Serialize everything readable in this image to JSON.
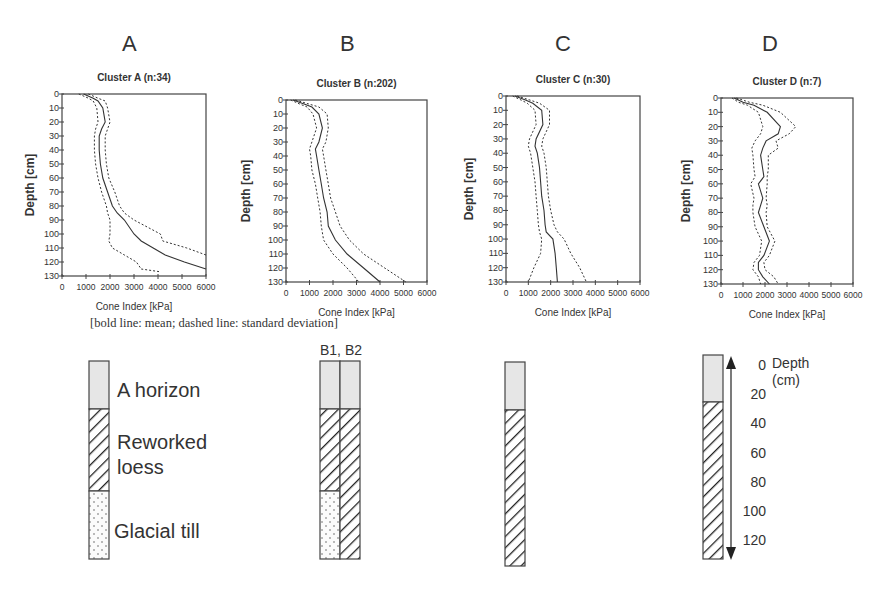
{
  "panel_letters": [
    "A",
    "B",
    "C",
    "D"
  ],
  "caption": "[bold line: mean; dashed line: standard deviation]",
  "legend": {
    "a_horizon": "A horizon",
    "reworked_loess_1": "Reworked",
    "reworked_loess_2": "loess",
    "glacial_till": "Glacial till",
    "b_columns_label": "B1, B2",
    "depth_title_1": "Depth",
    "depth_title_2": "(cm)",
    "depth_ticks": [
      "0",
      "20",
      "40",
      "60",
      "80",
      "100",
      "120"
    ]
  },
  "colors": {
    "a_horizon_fill": "#e6e6e6",
    "line": "#333333",
    "frame": "#444444"
  },
  "chart_data": [
    {
      "type": "line",
      "title": "Cluster A (n:34)",
      "xlabel": "Cone Index [kPa]",
      "ylabel": "Depth [cm]",
      "xlim": [
        0,
        6000
      ],
      "ylim": [
        0,
        130
      ],
      "y_inverted": true,
      "xticks": [
        "0",
        "1000",
        "2000",
        "3000",
        "4000",
        "5000",
        "6000"
      ],
      "yticks": [
        "0",
        "10",
        "20",
        "30",
        "40",
        "50",
        "60",
        "70",
        "80",
        "90",
        "100",
        "110",
        "120",
        "130"
      ],
      "depth": [
        0,
        3,
        5,
        10,
        20,
        25,
        30,
        40,
        50,
        60,
        70,
        80,
        85,
        90,
        100,
        105,
        110,
        115,
        120,
        125
      ],
      "series": [
        {
          "name": "mean",
          "style": "solid",
          "values": [
            900,
            1300,
            1500,
            1700,
            1800,
            1650,
            1550,
            1550,
            1600,
            1700,
            1900,
            2100,
            2300,
            2600,
            3000,
            3300,
            3800,
            4300,
            5100,
            6000
          ]
        },
        {
          "name": "mean + sd",
          "style": "dashed",
          "values": [
            1100,
            1500,
            1800,
            1900,
            2000,
            1900,
            1800,
            1800,
            1850,
            1950,
            2200,
            2400,
            2600,
            3000,
            4100,
            4200,
            5200,
            6000,
            null,
            null
          ]
        },
        {
          "name": "mean - sd",
          "style": "dashed",
          "values": [
            700,
            1100,
            1300,
            1450,
            1500,
            1400,
            1350,
            1350,
            1400,
            1500,
            1650,
            1850,
            1900,
            2000,
            2000,
            1950,
            2100,
            2600,
            3100,
            3300
          ]
        }
      ],
      "extra_sd_tail": {
        "depth": [
          125,
          127
        ],
        "values": [
          3300,
          4100
        ]
      }
    },
    {
      "type": "line",
      "title": "Cluster B (n:202)",
      "xlabel": "Cone Index [kPa]",
      "ylabel": "Depth [cm]",
      "xlim": [
        0,
        6000
      ],
      "ylim": [
        0,
        130
      ],
      "y_inverted": true,
      "xticks": [
        "0",
        "1000",
        "2000",
        "3000",
        "4000",
        "5000",
        "6000"
      ],
      "yticks": [
        "0",
        "10",
        "20",
        "30",
        "40",
        "50",
        "60",
        "70",
        "80",
        "90",
        "100",
        "110",
        "120",
        "130"
      ],
      "depth": [
        0,
        3,
        5,
        10,
        20,
        30,
        35,
        40,
        50,
        60,
        70,
        80,
        90,
        100,
        110,
        120,
        130
      ],
      "series": [
        {
          "name": "mean",
          "style": "solid",
          "values": [
            300,
            800,
            1100,
            1400,
            1550,
            1400,
            1250,
            1300,
            1400,
            1500,
            1600,
            1750,
            1800,
            2100,
            2600,
            3300,
            4000
          ]
        },
        {
          "name": "mean + sd",
          "style": "dashed",
          "values": [
            400,
            1000,
            1400,
            1750,
            1800,
            1700,
            1550,
            1600,
            1700,
            1800,
            1900,
            2100,
            2300,
            2700,
            3300,
            4200,
            5100
          ]
        },
        {
          "name": "mean - sd",
          "style": "dashed",
          "values": [
            200,
            600,
            900,
            1150,
            1300,
            1100,
            1000,
            1050,
            1100,
            1250,
            1350,
            1450,
            1500,
            1600,
            2000,
            2600,
            3100
          ]
        }
      ]
    },
    {
      "type": "line",
      "title": "Cluster C (n:30)",
      "xlabel": "Cone Index [kPa]",
      "ylabel": "Depth [cm]",
      "xlim": [
        0,
        6000
      ],
      "ylim": [
        0,
        130
      ],
      "y_inverted": true,
      "xticks": [
        "0",
        "1000",
        "2000",
        "3000",
        "4000",
        "5000",
        "6000"
      ],
      "yticks": [
        "0",
        "10",
        "20",
        "30",
        "40",
        "50",
        "60",
        "70",
        "80",
        "90",
        "100",
        "110",
        "120",
        "130"
      ],
      "depth": [
        0,
        3,
        5,
        10,
        20,
        30,
        35,
        40,
        50,
        60,
        70,
        80,
        90,
        95,
        100,
        110,
        120,
        130
      ],
      "series": [
        {
          "name": "mean",
          "style": "solid",
          "values": [
            400,
            900,
            1200,
            1600,
            1650,
            1350,
            1300,
            1400,
            1500,
            1550,
            1600,
            1700,
            1750,
            1800,
            2100,
            2200,
            2250,
            2300
          ]
        },
        {
          "name": "mean + sd",
          "style": "dashed",
          "values": [
            500,
            1100,
            1500,
            1950,
            1950,
            1650,
            1600,
            1700,
            1800,
            1850,
            1900,
            2000,
            2150,
            2300,
            2600,
            2900,
            3300,
            3600
          ]
        },
        {
          "name": "mean - sd",
          "style": "dashed",
          "values": [
            300,
            700,
            950,
            1300,
            1350,
            1050,
            1000,
            1100,
            1200,
            1300,
            1350,
            1400,
            1450,
            1500,
            1600,
            1550,
            1250,
            1000
          ]
        }
      ]
    },
    {
      "type": "line",
      "title": "Cluster D (n:7)",
      "xlabel": "Cone Index [kPa]",
      "ylabel": "Depth [cm]",
      "xlim": [
        0,
        6000
      ],
      "ylim": [
        0,
        130
      ],
      "y_inverted": true,
      "xticks": [
        "0",
        "1000",
        "2000",
        "3000",
        "4000",
        "5000",
        "6000"
      ],
      "yticks": [
        "0",
        "10",
        "20",
        "30",
        "40",
        "50",
        "60",
        "70",
        "80",
        "90",
        "100",
        "110",
        "120",
        "130"
      ],
      "depth": [
        0,
        3,
        5,
        10,
        20,
        25,
        30,
        35,
        40,
        50,
        55,
        60,
        70,
        75,
        80,
        90,
        100,
        110,
        115,
        120,
        125,
        130
      ],
      "series": [
        {
          "name": "mean",
          "style": "solid",
          "values": [
            600,
            1000,
            1500,
            2100,
            2700,
            2600,
            2050,
            1900,
            1800,
            1900,
            1950,
            1700,
            1900,
            1800,
            1700,
            1950,
            2200,
            1950,
            1700,
            1700,
            1900,
            2200
          ]
        },
        {
          "name": "mean + sd",
          "style": "dashed",
          "values": [
            700,
            1300,
            1900,
            2700,
            3400,
            3100,
            2500,
            2600,
            2150,
            2150,
            2100,
            2100,
            2050,
            2100,
            2050,
            2100,
            2450,
            2200,
            1950,
            2000,
            2400,
            2600
          ]
        },
        {
          "name": "mean - sd",
          "style": "dashed",
          "values": [
            500,
            800,
            1200,
            1700,
            1900,
            1800,
            1550,
            1400,
            1450,
            1500,
            1550,
            1350,
            1500,
            1450,
            1450,
            1550,
            1850,
            1750,
            1500,
            1450,
            1700,
            1800
          ]
        }
      ]
    }
  ]
}
